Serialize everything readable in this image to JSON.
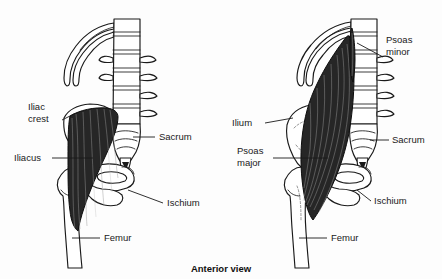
{
  "figure": {
    "caption": "Anterior view",
    "panels": [
      {
        "id": "left-panel",
        "name": "iliacus-panel",
        "labels": [
          {
            "id": "iliac-crest",
            "line1": "Iliac",
            "line2": "crest"
          },
          {
            "id": "iliacus",
            "line1": "Iliacus",
            "line2": ""
          },
          {
            "id": "sacrum",
            "line1": "Sacrum",
            "line2": ""
          },
          {
            "id": "ischium",
            "line1": "Ischium",
            "line2": ""
          },
          {
            "id": "femur",
            "line1": "Femur",
            "line2": ""
          }
        ],
        "structures": [
          "ribs",
          "lumbar-vertebrae",
          "sacrum",
          "coccyx",
          "ilium",
          "ischium",
          "pubis",
          "femur",
          "iliacus-muscle"
        ]
      },
      {
        "id": "right-panel",
        "name": "psoas-panel",
        "labels": [
          {
            "id": "psoas-minor",
            "line1": "Psoas",
            "line2": "minor"
          },
          {
            "id": "ilium",
            "line1": "Ilium",
            "line2": ""
          },
          {
            "id": "psoas-major",
            "line1": "Psoas",
            "line2": "major"
          },
          {
            "id": "sacrum",
            "line1": "Sacrum",
            "line2": ""
          },
          {
            "id": "ischium",
            "line1": "Ischium",
            "line2": ""
          },
          {
            "id": "femur",
            "line1": "Femur",
            "line2": ""
          }
        ],
        "structures": [
          "ribs",
          "lumbar-vertebrae",
          "sacrum",
          "coccyx",
          "ilium",
          "ischium",
          "pubis",
          "femur",
          "psoas-major-muscle",
          "psoas-minor-tendon"
        ]
      }
    ]
  },
  "colors": {
    "background": "#fdfdfd",
    "ink": "#1a1a1a",
    "muscle": "#262626",
    "bone_fill": "#ffffff",
    "fiber": "#9a9a9a"
  }
}
